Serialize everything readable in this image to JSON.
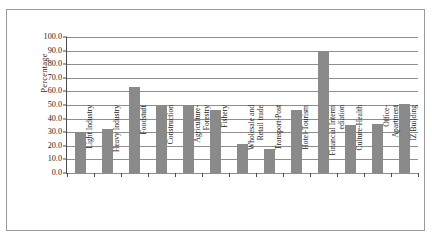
{
  "chart_data": {
    "type": "bar",
    "title": "",
    "xlabel": "",
    "ylabel": "Percentage",
    "ylim": [
      0,
      100
    ],
    "ytick_labels": [
      "100.0",
      "90.0",
      "80.0",
      "70.0",
      "60.0",
      "50.0",
      "40.0",
      "30.0",
      "20.0",
      "10.0",
      "0.0"
    ],
    "ytick_values": [
      100,
      90,
      80,
      70,
      60,
      50,
      40,
      30,
      20,
      10,
      0
    ],
    "grid": true,
    "legend": "none",
    "bar_color": "#8a8a8a",
    "categories": [
      "Light Industry",
      "Heavy Industry",
      "Foodstuff",
      "Construction",
      "Agriculture-Forestry",
      "Fishery",
      "Wholesale and Retail trade",
      "Transport-Post",
      "Hotel-Tourism",
      "Financial Intermediation",
      "Culture-Health",
      "Office-Apartment",
      "IZ Building"
    ],
    "category_lines": [
      [
        "Light Industry"
      ],
      [
        "Heavy Industry"
      ],
      [
        "Foodstuff"
      ],
      [
        "Construction"
      ],
      [
        "Agriculture-",
        "Forestry"
      ],
      [
        "Fishery"
      ],
      [
        "Wholesale and",
        "Retail trade"
      ],
      [
        "Transport-Post"
      ],
      [
        "Hotel-Tourism"
      ],
      [
        "Financial Interm",
        "ediation"
      ],
      [
        "Culture-Health"
      ],
      [
        "Office-",
        "Apartment"
      ],
      [
        "IZ Building"
      ]
    ],
    "values": [
      30,
      32,
      63,
      50,
      50,
      46,
      21,
      18,
      46,
      90,
      35,
      36,
      51
    ]
  }
}
